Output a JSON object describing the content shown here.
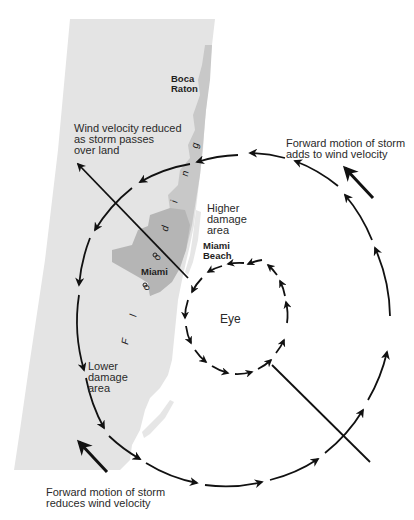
{
  "diagram": {
    "colors": {
      "land": "#e3e3e3",
      "flood_zone": "#c4c4c4",
      "city_zone": "#b0b0b0",
      "water": "#ffffff",
      "arrows": "#111111",
      "text": "#2a2a2a"
    },
    "cities": {
      "boca_raton": [
        "Boca",
        "Raton"
      ],
      "miami": "Miami",
      "miami_beach": [
        "Miami",
        "Beach"
      ]
    },
    "labels": {
      "wind_reduced_land": [
        "Wind velocity reduced",
        "as storm passes",
        "over land"
      ],
      "forward_adds": [
        "Forward motion of storm",
        "adds to wind velocity"
      ],
      "higher_damage": [
        "Higher",
        "damage",
        "area"
      ],
      "lower_damage": [
        "Lower",
        "damage",
        "area"
      ],
      "eye": "Eye",
      "forward_reduces": [
        "Forward motion of storm",
        "reduces wind velocity"
      ],
      "flooding": [
        "F",
        "l",
        "o",
        "o",
        "d",
        "i",
        "n",
        "g"
      ]
    },
    "elements": {
      "outer_wind_circle": "counterclockwise circulation with arrows",
      "eye_wall_circle": "dashed counterclockwise arrows around eye",
      "storm_track_line": "diagonal line from lower right through eye to upper left"
    }
  }
}
